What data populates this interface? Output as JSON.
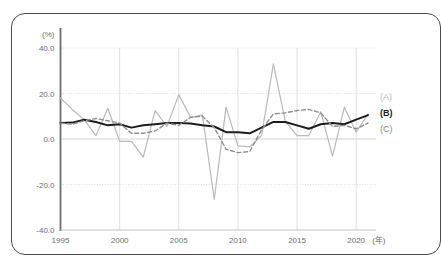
{
  "chart_data": {
    "type": "line",
    "title": "",
    "xlabel": "(年)",
    "ylabel": "(%)",
    "unit_label": "(%)",
    "x_unit_label": "(年)",
    "xlim": [
      1995,
      2021
    ],
    "ylim": [
      -40.0,
      40.0
    ],
    "grid": true,
    "legend_position": "right",
    "x_tick_labels": [
      "1995",
      "2000",
      "2005",
      "2010",
      "2015",
      "2020"
    ],
    "x_ticks": [
      1995,
      2000,
      2005,
      2010,
      2015,
      2020
    ],
    "y_tick_labels": [
      "40.0",
      "20.0",
      "0.0",
      "-20.0",
      "-40.0"
    ],
    "y_ticks": [
      40.0,
      20.0,
      0.0,
      -20.0,
      -40.0
    ],
    "x": [
      1995,
      1996,
      1997,
      1998,
      1999,
      2000,
      2001,
      2002,
      2003,
      2004,
      2005,
      2006,
      2007,
      2008,
      2009,
      2010,
      2011,
      2012,
      2013,
      2014,
      2015,
      2016,
      2017,
      2018,
      2019,
      2020,
      2021
    ],
    "series": [
      {
        "name": "(A)",
        "label": "(A)",
        "color": "#b9b9b9",
        "style": "solid",
        "width": 1.2,
        "values": [
          18.0,
          13.0,
          8.5,
          1.5,
          13.5,
          -1.0,
          -1.0,
          -8.0,
          12.5,
          5.5,
          19.5,
          9.5,
          10.5,
          -26.5,
          14.0,
          -3.0,
          -3.5,
          1.5,
          33.0,
          8.0,
          1.5,
          1.5,
          12.0,
          -7.5,
          14.0,
          3.0,
          11.0
        ]
      },
      {
        "name": "(B)",
        "label": "(B)",
        "color": "#1d1d1d",
        "style": "solid",
        "width": 2.0,
        "values": [
          7.0,
          7.2,
          8.5,
          7.5,
          6.0,
          6.5,
          5.0,
          6.0,
          6.5,
          7.0,
          7.0,
          6.8,
          6.0,
          5.5,
          3.0,
          3.0,
          2.5,
          5.0,
          7.5,
          7.5,
          6.0,
          4.5,
          6.5,
          7.0,
          6.5,
          8.5,
          10.5
        ]
      },
      {
        "name": "(C)",
        "label": "(C)",
        "color": "#8e8e8e",
        "style": "dashed",
        "width": 1.4,
        "values": [
          7.0,
          6.5,
          8.0,
          9.0,
          8.0,
          7.0,
          2.5,
          2.5,
          3.5,
          7.0,
          6.0,
          9.5,
          10.0,
          5.0,
          -4.5,
          -6.0,
          -5.5,
          4.0,
          11.0,
          11.5,
          12.5,
          13.0,
          11.5,
          5.5,
          6.0,
          4.5,
          7.0
        ]
      }
    ]
  },
  "legend": {
    "items": [
      {
        "label": "(A)"
      },
      {
        "label": "(B)"
      },
      {
        "label": "(C)"
      }
    ]
  }
}
